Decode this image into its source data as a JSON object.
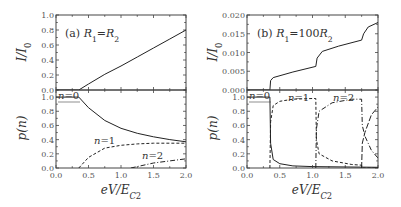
{
  "figure": {
    "panels": [
      {
        "id": "a",
        "tag": "(a)",
        "condition": {
          "R": "R",
          "sub1": "1",
          "eq": "=",
          "rhs": "R",
          "sub2": "2",
          "prefix": ""
        }
      },
      {
        "id": "b",
        "tag": "(b)",
        "condition": {
          "R": "R",
          "sub1": "1",
          "eq": "=",
          "rhs": "R",
          "sub2": "2",
          "prefix": "100"
        }
      }
    ],
    "xlabel": {
      "main": "eV/E",
      "sub": "C",
      "subsub": "2"
    },
    "ylabel_top": "I/I",
    "ylabel_top_sub": "0",
    "ylabel_bottom": "p(n)"
  },
  "chart_data": [
    {
      "panel": "(a) top",
      "type": "line",
      "title": "(a) R1=R2",
      "xlabel": "eV/E_C2",
      "ylabel": "I/I0",
      "xlim": [
        0.0,
        2.0
      ],
      "ylim": [
        0.0,
        1.0
      ],
      "xticks": [
        "0.0",
        "0.5",
        "1.0",
        "1.5",
        "2.0"
      ],
      "yticks": [
        "0.0",
        "0.2",
        "0.4",
        "0.6",
        "0.8",
        "1.0"
      ],
      "series": [
        {
          "name": "I/I0",
          "style": "solid",
          "x": [
            0.0,
            0.35,
            0.5,
            0.75,
            1.0,
            1.25,
            1.5,
            1.75,
            2.0
          ],
          "y": [
            0.0,
            0.0,
            0.08,
            0.21,
            0.32,
            0.44,
            0.56,
            0.68,
            0.8
          ]
        }
      ]
    },
    {
      "panel": "(a) bottom",
      "type": "line",
      "xlabel": "eV/E_C2",
      "ylabel": "p(n)",
      "xlim": [
        0.0,
        2.0
      ],
      "ylim": [
        0.0,
        1.1
      ],
      "xticks": [
        "0.0",
        "0.5",
        "1.0",
        "1.5",
        "2.0"
      ],
      "yticks": [
        "0.0",
        "0.2",
        "0.4",
        "0.6",
        "0.8",
        "1.0"
      ],
      "series": [
        {
          "name": "n=0",
          "style": "solid",
          "x": [
            0.0,
            0.35,
            0.5,
            0.75,
            1.0,
            1.25,
            1.5,
            1.75,
            2.0
          ],
          "y": [
            1.0,
            1.0,
            0.85,
            0.67,
            0.56,
            0.49,
            0.44,
            0.4,
            0.37
          ]
        },
        {
          "name": "n=1",
          "style": "dashed",
          "x": [
            0.35,
            0.5,
            0.75,
            1.0,
            1.25,
            1.5,
            1.75,
            2.0
          ],
          "y": [
            0.0,
            0.15,
            0.28,
            0.32,
            0.34,
            0.35,
            0.35,
            0.35
          ]
        },
        {
          "name": "n=2",
          "style": "dash-dot",
          "x": [
            1.15,
            1.25,
            1.5,
            1.75,
            2.0
          ],
          "y": [
            0.0,
            0.02,
            0.07,
            0.1,
            0.13
          ]
        }
      ],
      "annotations": [
        "n=0",
        "n=1",
        "n=2"
      ]
    },
    {
      "panel": "(b) top",
      "type": "line",
      "title": "(b) R1=100R2",
      "xlabel": "eV/E_C2",
      "ylabel": "I/I0",
      "xlim": [
        0.0,
        2.0
      ],
      "ylim": [
        0.0,
        0.02
      ],
      "xticks": [
        "0.0",
        "0.5",
        "1.0",
        "1.5",
        "2.0"
      ],
      "yticks": [
        "0.000",
        "0.005",
        "0.010",
        "0.015",
        "0.020"
      ],
      "series": [
        {
          "name": "I/I0",
          "style": "solid",
          "x": [
            0.0,
            0.35,
            0.36,
            0.4,
            0.7,
            1.05,
            1.07,
            1.15,
            1.4,
            1.75,
            1.78,
            1.85,
            2.0
          ],
          "y": [
            0.0,
            0.0,
            0.0025,
            0.0033,
            0.0048,
            0.0063,
            0.0085,
            0.0103,
            0.0117,
            0.0133,
            0.015,
            0.0168,
            0.018
          ]
        }
      ]
    },
    {
      "panel": "(b) bottom",
      "type": "line",
      "xlabel": "eV/E_C2",
      "ylabel": "p(n)",
      "xlim": [
        0.0,
        2.0
      ],
      "ylim": [
        0.0,
        1.1
      ],
      "xticks": [
        "0.0",
        "0.5",
        "1.0",
        "1.5",
        "2.0"
      ],
      "yticks": [
        "0.0",
        "0.2",
        "0.4",
        "0.6",
        "0.8",
        "1.0"
      ],
      "series": [
        {
          "name": "n=0",
          "style": "solid",
          "x": [
            0.0,
            0.35,
            0.36,
            0.4,
            0.5,
            0.7,
            1.0,
            2.0
          ],
          "y": [
            1.0,
            1.0,
            0.35,
            0.12,
            0.06,
            0.03,
            0.02,
            0.01
          ]
        },
        {
          "name": "n=1",
          "style": "dashed",
          "x": [
            0.35,
            0.36,
            0.4,
            0.5,
            0.7,
            1.0,
            1.05,
            1.06,
            1.1,
            1.3,
            1.6,
            1.75,
            1.76,
            2.0
          ],
          "y": [
            0.0,
            0.65,
            0.88,
            0.94,
            0.97,
            0.98,
            0.98,
            0.4,
            0.2,
            0.1,
            0.05,
            0.04,
            0.0,
            0.0
          ]
        },
        {
          "name": "n=2",
          "style": "dash-dot",
          "x": [
            1.05,
            1.06,
            1.1,
            1.3,
            1.6,
            1.75,
            1.76,
            1.8,
            1.9,
            2.0
          ],
          "y": [
            0.0,
            0.55,
            0.8,
            0.92,
            0.97,
            0.97,
            0.6,
            0.45,
            0.25,
            0.14
          ]
        },
        {
          "name": "n=3",
          "style": "long-dash",
          "x": [
            1.75,
            1.76,
            1.8,
            1.9,
            2.0
          ],
          "y": [
            0.0,
            0.35,
            0.5,
            0.75,
            0.86
          ]
        }
      ],
      "annotations": [
        "n=0",
        "n=1",
        "n=2"
      ]
    }
  ]
}
